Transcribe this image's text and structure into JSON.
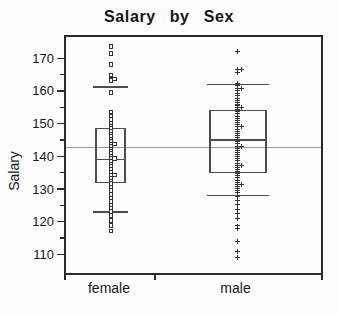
{
  "chart_data": {
    "type": "box",
    "title": "Salary by Sex",
    "ylabel": "Salary",
    "xlabel": "",
    "categories": [
      "female",
      "male"
    ],
    "grid": false,
    "legend": "none",
    "reference_line": 142.8,
    "yticks_major": [
      110,
      120,
      130,
      140,
      150,
      160,
      170
    ],
    "yticks_minor": [
      115,
      125,
      135,
      145,
      155,
      165
    ],
    "series": [
      {
        "name": "female",
        "marker": "open-square",
        "q1": 132,
        "median": 139,
        "q3": 148.5,
        "lower_fence": 123,
        "upper_fence": 161.2,
        "center_x": 111,
        "box_left": 96,
        "box_right": 125,
        "points": [
          173.5,
          171.5,
          168,
          164.9,
          163.7,
          163.7,
          163.1,
          159.6,
          153.5,
          152.3,
          151.2,
          150.2,
          149.3,
          148.5,
          147.6,
          146.8,
          146.0,
          145.2,
          144.5,
          143.8,
          143.8,
          143.0,
          142.2,
          141.5,
          140.8,
          140.0,
          139.3,
          139.3,
          138.5,
          137.6,
          136.8,
          136.0,
          135.1,
          134.3,
          134.3,
          133.4,
          132.5,
          131.6,
          130.6,
          129.5,
          128.4,
          127.3,
          126.2,
          125.1,
          124.0,
          123.2,
          121.9,
          120.3,
          118.8,
          117.2
        ]
      },
      {
        "name": "male",
        "marker": "plus",
        "q1": 135,
        "median": 145,
        "q3": 154,
        "lower_fence": 128,
        "upper_fence": 162,
        "center_x": 237.5,
        "box_left": 210,
        "box_right": 266,
        "points": [
          172,
          166.6,
          166.6,
          165.6,
          162.4,
          161.6,
          160.8,
          160.8,
          160.0,
          159.2,
          158.5,
          157.8,
          157.1,
          156.4,
          155.7,
          155.0,
          155.0,
          154.3,
          153.6,
          153.0,
          152.3,
          151.6,
          151.0,
          150.3,
          149.6,
          149.0,
          149.0,
          148.3,
          147.7,
          147.0,
          146.4,
          145.7,
          145.1,
          144.4,
          143.8,
          143.1,
          143.1,
          142.5,
          141.8,
          141.2,
          140.5,
          139.9,
          139.2,
          138.6,
          137.9,
          137.3,
          137.3,
          136.6,
          136.0,
          135.3,
          134.7,
          134.0,
          133.4,
          132.7,
          132.1,
          131.4,
          131.4,
          130.8,
          130.1,
          129.5,
          128.8,
          127.8,
          126.6,
          125.2,
          123.7,
          122.5,
          120.9,
          118.7,
          117.8,
          114.0,
          111.0,
          109.0
        ]
      }
    ],
    "layout": {
      "ylim": [
        104,
        176.8
      ],
      "plot": {
        "left": 65,
        "top": 36,
        "right": 322,
        "bottom": 274
      },
      "x_ticks": [
        65,
        155,
        322
      ],
      "category_label_y": 280
    },
    "colors": {
      "frame": "#2a2a2a",
      "box": "#4d4d4d",
      "points": "#333333",
      "reference_line": "#9b9b9b",
      "text": "#161616",
      "background": "#fdfdfd"
    }
  }
}
